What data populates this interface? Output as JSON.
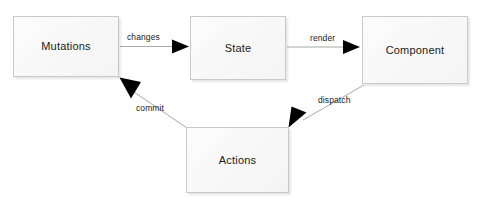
{
  "diagram": {
    "type": "flow-diagram",
    "title": "",
    "background_color": "#ffffff",
    "node_fill_color": "#f7f7f7",
    "node_border_color": "#c9c9c9",
    "edge_color": "#999999",
    "arrowhead_color": "#000000",
    "text_color": "#1a1a1a",
    "nodes": [
      {
        "id": "mutations",
        "label": "Mutations"
      },
      {
        "id": "state",
        "label": "State"
      },
      {
        "id": "component",
        "label": "Component"
      },
      {
        "id": "actions",
        "label": "Actions"
      }
    ],
    "edges": [
      {
        "id": "changes",
        "label": "changes",
        "from": "mutations",
        "to": "state"
      },
      {
        "id": "render",
        "label": "render",
        "from": "state",
        "to": "component"
      },
      {
        "id": "dispatch",
        "label": "dispatch",
        "from": "component",
        "to": "actions"
      },
      {
        "id": "commit",
        "label": "commit",
        "from": "actions",
        "to": "mutations"
      }
    ]
  }
}
